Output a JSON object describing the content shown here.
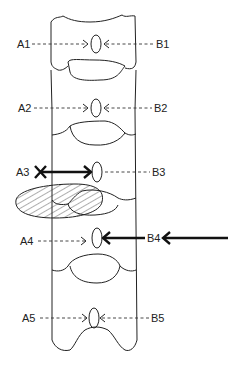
{
  "diagram": {
    "type": "spinal column schematic",
    "colors": {
      "line": "#222222",
      "background": "#ffffff"
    },
    "labels_left": [
      {
        "id": "A1",
        "text": "A1",
        "y": 44
      },
      {
        "id": "A2",
        "text": "A2",
        "y": 108
      },
      {
        "id": "A3",
        "text": "A3",
        "y": 172
      },
      {
        "id": "A4",
        "text": "A4",
        "y": 241
      },
      {
        "id": "A5",
        "text": "A5",
        "y": 318
      }
    ],
    "labels_right": [
      {
        "id": "B1",
        "text": "B1",
        "y": 44
      },
      {
        "id": "B2",
        "text": "B2",
        "y": 108
      },
      {
        "id": "B3",
        "text": "B3",
        "y": 172
      },
      {
        "id": "B4",
        "text": "B4",
        "y": 238
      },
      {
        "id": "B5",
        "text": "B5",
        "y": 318
      }
    ],
    "notes": {
      "A3": "bold arrow with X at origin (blocked path)",
      "B4": "bold arrow extending from right edge",
      "herniation": "hatched ellipse at level between A3 and A4"
    }
  }
}
